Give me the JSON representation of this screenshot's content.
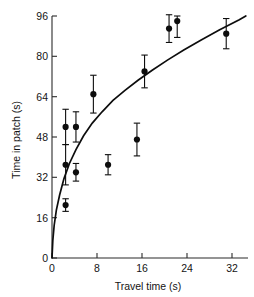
{
  "chart_data": {
    "type": "scatter",
    "title": "",
    "xlabel": "Travel time (s)",
    "ylabel": "Time in patch (s)",
    "xlim": [
      0,
      36
    ],
    "ylim": [
      0,
      96
    ],
    "xticks": [
      0,
      8,
      16,
      24,
      32
    ],
    "yticks": [
      0,
      16,
      32,
      48,
      64,
      80,
      96
    ],
    "xtick_labels": [
      "0",
      "8",
      "16",
      "24",
      "32"
    ],
    "ytick_labels": [
      "0",
      "16",
      "32",
      "48",
      "64",
      "80",
      "96"
    ],
    "grid": false,
    "legend": null,
    "marker_color": "#0d0d0d",
    "curve_color": "#0d0d0d",
    "series": [
      {
        "name": "Time in patch (mean ± SE)",
        "marker": "filled-circle",
        "errorbars": true,
        "points": [
          {
            "x": 2.5,
            "y": 21,
            "yerr_low": 2.5,
            "yerr_high": 2.5
          },
          {
            "x": 2.5,
            "y": 37,
            "yerr_low": 8.0,
            "yerr_high": 8.0
          },
          {
            "x": 2.5,
            "y": 52,
            "yerr_low": 7.0,
            "yerr_high": 7.0
          },
          {
            "x": 4.4,
            "y": 34,
            "yerr_low": 3.5,
            "yerr_high": 3.5
          },
          {
            "x": 4.4,
            "y": 52,
            "yerr_low": 6.0,
            "yerr_high": 6.0
          },
          {
            "x": 7.6,
            "y": 65,
            "yerr_low": 7.5,
            "yerr_high": 7.5
          },
          {
            "x": 10.3,
            "y": 37,
            "yerr_low": 4.0,
            "yerr_high": 4.0
          },
          {
            "x": 15.6,
            "y": 47,
            "yerr_low": 6.5,
            "yerr_high": 6.5
          },
          {
            "x": 17.0,
            "y": 74,
            "yerr_low": 6.5,
            "yerr_high": 6.5
          },
          {
            "x": 21.5,
            "y": 91,
            "yerr_low": 5.5,
            "yerr_high": 5.5
          },
          {
            "x": 23.0,
            "y": 94,
            "yerr_low": 6.5,
            "yerr_high": 2.0
          },
          {
            "x": 32.0,
            "y": 89,
            "yerr_low": 6.0,
            "yerr_high": 6.0
          }
        ]
      }
    ],
    "fit_curve": {
      "name": "marginal value theorem prediction",
      "x": [
        0.0,
        0.15,
        0.4,
        0.8,
        1.4,
        2.2,
        3.2,
        4.4,
        5.8,
        7.4,
        9.2,
        11.2,
        13.4,
        15.8,
        18.4,
        21.2,
        24.2,
        27.4,
        30.8,
        34.4,
        35.6
      ],
      "y": [
        0.0,
        7.0,
        13.0,
        19.0,
        25.0,
        31.5,
        37.5,
        43.0,
        48.5,
        53.5,
        58.0,
        62.5,
        66.5,
        70.5,
        74.5,
        78.5,
        82.5,
        86.5,
        90.5,
        94.5,
        96.0
      ]
    }
  }
}
